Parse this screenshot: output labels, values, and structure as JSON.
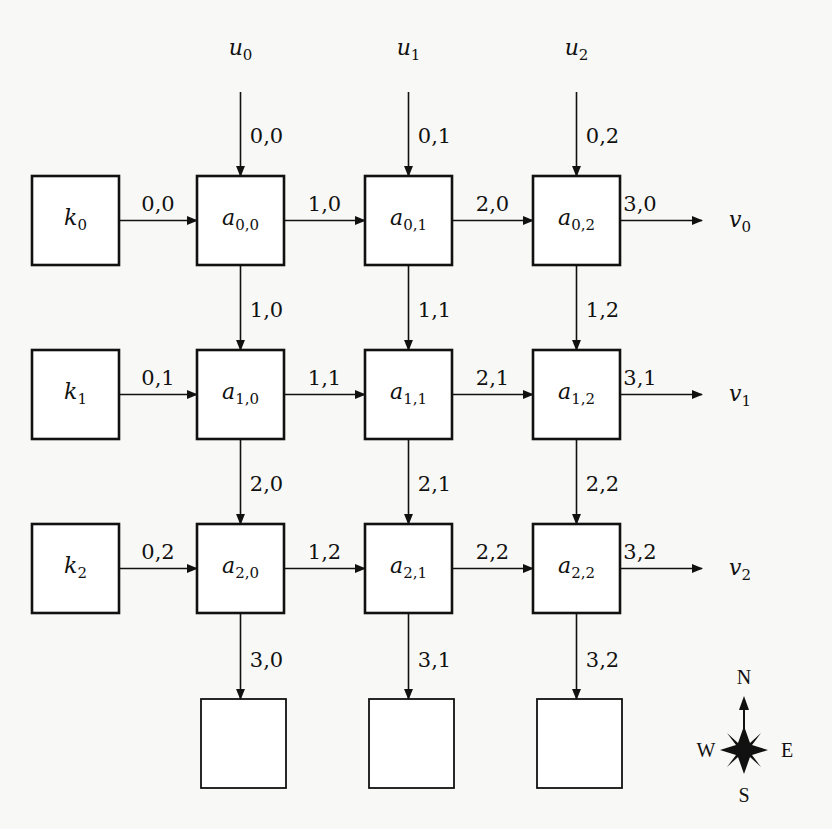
{
  "diagram": {
    "type": "systolic-array-grid",
    "rows": 3,
    "cols": 3,
    "inputs_top": [
      {
        "name": "u",
        "sub": "0",
        "edge_label": "0,0"
      },
      {
        "name": "u",
        "sub": "1",
        "edge_label": "0,1"
      },
      {
        "name": "u",
        "sub": "2",
        "edge_label": "0,2"
      }
    ],
    "inputs_left": [
      {
        "name": "k",
        "sub": "0",
        "edge_label": "0,0"
      },
      {
        "name": "k",
        "sub": "1",
        "edge_label": "0,1"
      },
      {
        "name": "k",
        "sub": "2",
        "edge_label": "0,2"
      }
    ],
    "outputs_right": [
      {
        "name": "v",
        "sub": "0",
        "edge_label": "3,0"
      },
      {
        "name": "v",
        "sub": "1",
        "edge_label": "3,1"
      },
      {
        "name": "v",
        "sub": "2",
        "edge_label": "3,2"
      }
    ],
    "cells": [
      [
        {
          "name": "a",
          "sub": "0,0"
        },
        {
          "name": "a",
          "sub": "0,1"
        },
        {
          "name": "a",
          "sub": "0,2"
        }
      ],
      [
        {
          "name": "a",
          "sub": "1,0"
        },
        {
          "name": "a",
          "sub": "1,1"
        },
        {
          "name": "a",
          "sub": "1,2"
        }
      ],
      [
        {
          "name": "a",
          "sub": "2,0"
        },
        {
          "name": "a",
          "sub": "2,1"
        },
        {
          "name": "a",
          "sub": "2,2"
        }
      ]
    ],
    "horizontal_edges": [
      [
        "1,0",
        "2,0"
      ],
      [
        "1,1",
        "2,1"
      ],
      [
        "1,2",
        "2,2"
      ]
    ],
    "vertical_edges": [
      [
        "1,0",
        "1,1",
        "1,2"
      ],
      [
        "2,0",
        "2,1",
        "2,2"
      ]
    ],
    "bottom_edges": [
      "3,0",
      "3,1",
      "3,2"
    ],
    "bottom_boxes": 3,
    "compass": {
      "north": "N",
      "south": "S",
      "east": "E",
      "west": "W"
    }
  }
}
